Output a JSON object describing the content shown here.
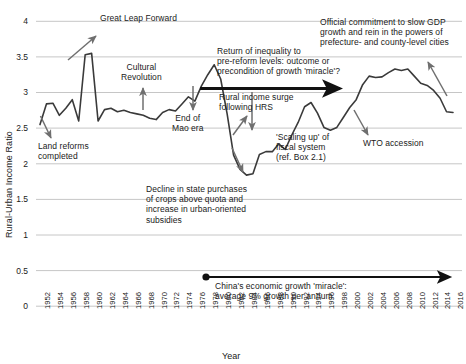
{
  "chart_data": {
    "type": "line",
    "title": "",
    "xlabel": "Year",
    "ylabel": "Rural-Urban Income Ratio",
    "ylim": [
      0,
      4
    ],
    "ytick_labels": [
      "0",
      "0.5",
      "1",
      "1.5",
      "2",
      "2.5",
      "3",
      "3.5",
      "4"
    ],
    "ytick_values": [
      0,
      0.5,
      1,
      1.5,
      2,
      2.5,
      3,
      3.5,
      4
    ],
    "grid": "horizontal",
    "legend": "none",
    "xlim": [
      1952,
      2016
    ],
    "xtick_labels": [
      "1952",
      "1954",
      "1956",
      "1958",
      "1960",
      "1962",
      "1964",
      "1966",
      "1968",
      "1970",
      "1972",
      "1974",
      "1976",
      "1978",
      "1980",
      "1982",
      "1984",
      "1986",
      "1988",
      "1990",
      "1992",
      "1994",
      "1996",
      "1998",
      "2000",
      "2002",
      "2004",
      "2006",
      "2008",
      "2010",
      "2012",
      "2014",
      "2016"
    ],
    "series": [
      {
        "name": "Rural-Urban Income Ratio",
        "color": "#3a3a3a",
        "x": [
          1952,
          1953,
          1954,
          1955,
          1956,
          1957,
          1958,
          1959,
          1960,
          1961,
          1962,
          1963,
          1964,
          1965,
          1966,
          1967,
          1968,
          1969,
          1970,
          1971,
          1972,
          1973,
          1974,
          1975,
          1976,
          1977,
          1978,
          1979,
          1980,
          1981,
          1982,
          1983,
          1984,
          1985,
          1986,
          1987,
          1988,
          1989,
          1990,
          1991,
          1992,
          1993,
          1994,
          1995,
          1996,
          1997,
          1998,
          1999,
          2000,
          2001,
          2002,
          2003,
          2004,
          2005,
          2006,
          2007,
          2008,
          2009,
          2010,
          2011,
          2012,
          2013,
          2014,
          2015,
          2016
        ],
        "values": [
          2.55,
          2.84,
          2.85,
          2.68,
          2.78,
          2.9,
          2.6,
          3.53,
          3.55,
          2.6,
          2.76,
          2.78,
          2.73,
          2.75,
          2.72,
          2.7,
          2.68,
          2.64,
          2.62,
          2.72,
          2.76,
          2.74,
          2.84,
          2.94,
          2.88,
          3.09,
          3.25,
          3.39,
          3.19,
          2.7,
          2.12,
          1.92,
          1.84,
          1.86,
          2.13,
          2.17,
          2.17,
          2.28,
          2.2,
          2.4,
          2.58,
          2.8,
          2.86,
          2.71,
          2.51,
          2.47,
          2.51,
          2.65,
          2.79,
          2.9,
          3.11,
          3.23,
          3.21,
          3.22,
          3.28,
          3.33,
          3.31,
          3.33,
          3.23,
          3.13,
          3.1,
          3.03,
          2.92,
          2.73,
          2.72
        ]
      }
    ],
    "annotations": [
      {
        "name": "great-leap-forward",
        "text": "Great Leap Forward"
      },
      {
        "name": "cultural-revolution",
        "text": "Cultural\nRevolution"
      },
      {
        "name": "land-reforms-completed",
        "text": "Land reforms\ncompleted"
      },
      {
        "name": "end-of-mao-era",
        "text": "End of\nMao era"
      },
      {
        "name": "rural-income-surge-hrs",
        "text": "Rural income surge\nfollowing HRS"
      },
      {
        "name": "return-of-inequality",
        "text": "Return of inequality to\npre-reform levels: outcome or\nprecondition of growth 'miracle'?"
      },
      {
        "name": "official-commitment-slow-gdp",
        "text": "Official commitment to slow GDP\ngrowth and rein in the powers of\nprefecture- and county-level cities"
      },
      {
        "name": "scaling-up-fiscal-system",
        "text": "'Scaling up' of\nfiscal system\n(ref. Box 2.1)"
      },
      {
        "name": "wto-accession",
        "text": "WTO accession"
      },
      {
        "name": "decline-state-purchases",
        "text": "Decline in state purchases\nof crops above quota and\nincrease in urban-oriented\nsubsidies"
      },
      {
        "name": "growth-miracle-span",
        "text": "China's economic growth 'miracle':\naverage 9% growth per annum"
      }
    ]
  }
}
